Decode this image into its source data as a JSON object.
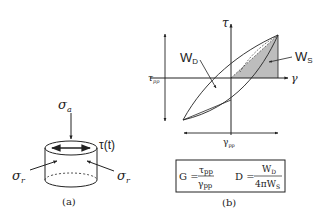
{
  "panel_a": {
    "caption": "(a)",
    "sigma_a": "σ",
    "sigma_a_sub": "a",
    "tau_t": "τ(t)",
    "sigma_r_left": "σ",
    "sigma_r_left_sub": "r",
    "sigma_r_right": "σ",
    "sigma_r_right_sub": "r"
  },
  "panel_b": {
    "caption": "(b)",
    "y_axis_label": "τ",
    "x_axis_label": "γ",
    "tau_pp_label": "τ",
    "tau_pp_sub": "pp",
    "gamma_pp_label": "γ",
    "gamma_pp_sub": "pp",
    "wd_label": "W",
    "wd_sub": "D",
    "ws_label": "W",
    "ws_sub": "S",
    "formula": {
      "g_lhs": "G =",
      "g_num": "τ",
      "g_num_sub": "pp",
      "g_den": "γ",
      "g_den_sub": "pp",
      "d_lhs": "D =",
      "d_num": "W",
      "d_num_sub": "D",
      "d_den": "4πW",
      "d_den_sub": "S"
    }
  }
}
